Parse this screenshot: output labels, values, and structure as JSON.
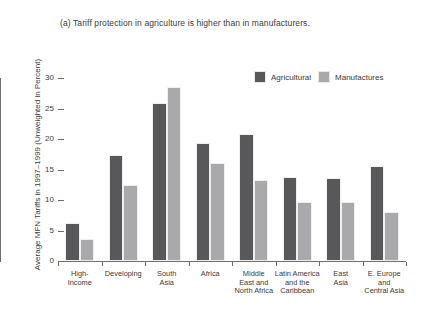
{
  "chart_data": {
    "type": "bar",
    "title": "(a) Tariff protection in agriculture is higher than in manufacturers.",
    "xlabel": "",
    "ylabel": "Average MFN Tariffs in 1997–1999 (Unweighted in Percent)",
    "ylim": [
      0,
      30
    ],
    "yticks": [
      0,
      5,
      10,
      15,
      20,
      25,
      30
    ],
    "ytick_labels": [
      "0",
      "5",
      "10",
      "15",
      "20",
      "25",
      "30"
    ],
    "grid": false,
    "legend_position": "top-right",
    "categories": [
      "High-\nIncome",
      "Developing",
      "South\nAsia",
      "Africa",
      "Middle\nEast and\nNorth Africa",
      "Latin America\nand the\nCaribbean",
      "East\nAsia",
      "E. Europe\nand\nCentral Asia"
    ],
    "category_lines": [
      [
        "High-",
        "Income"
      ],
      [
        "Developing"
      ],
      [
        "South",
        "Asia"
      ],
      [
        "Africa"
      ],
      [
        "Middle",
        "East and",
        "North Africa"
      ],
      [
        "Latin America",
        "and the",
        "Caribbean"
      ],
      [
        "East",
        "Asia"
      ],
      [
        "E. Europe",
        "and",
        "Central Asia"
      ]
    ],
    "series": [
      {
        "name": "Agricultural",
        "color": "#58585a",
        "values": [
          6.2,
          17.4,
          25.9,
          19.4,
          20.8,
          13.7,
          13.6,
          15.6
        ]
      },
      {
        "name": "Manufactures",
        "color": "#a9a9ab",
        "values": [
          3.6,
          12.5,
          28.5,
          16.0,
          13.2,
          9.7,
          9.6,
          8.0
        ]
      }
    ]
  },
  "legend": {
    "entries": [
      {
        "label": "Agricultural",
        "swatch": "agricultural"
      },
      {
        "label": "Manufactures",
        "swatch": "manufactures"
      }
    ]
  }
}
